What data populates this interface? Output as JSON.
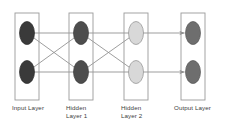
{
  "diagram": {
    "type": "neural-network-architecture",
    "title": "",
    "background_color": "#ffffff",
    "edge_color": "#8c8c8c",
    "box_stroke_color": "#9a9a9a",
    "label_color": "#3c3c3c",
    "layers": [
      {
        "id": "input",
        "label_lines": [
          "Input Layer"
        ],
        "node_count": 2,
        "node_fill": "#3a3a3a",
        "node_stroke": "#2e2e2e",
        "box": {
          "x": 15,
          "y": 13,
          "w": 24,
          "h": 87
        },
        "label_x": 12,
        "label_y": 104
      },
      {
        "id": "hidden1",
        "label_lines": [
          "Hidden",
          "Layer 1"
        ],
        "node_count": 2,
        "node_fill": "#4d4d4d",
        "node_stroke": "#3d3d3d",
        "box": {
          "x": 69,
          "y": 13,
          "w": 24,
          "h": 87
        },
        "label_x": 66,
        "label_y": 104
      },
      {
        "id": "hidden2",
        "label_lines": [
          "Hidden",
          "Layer 2"
        ],
        "node_count": 2,
        "node_fill": "#d8d8d8",
        "node_stroke": "#8f8f8f",
        "box": {
          "x": 124,
          "y": 13,
          "w": 24,
          "h": 87
        },
        "label_x": 121,
        "label_y": 104
      },
      {
        "id": "output",
        "label_lines": [
          "Output Layer"
        ],
        "node_count": 2,
        "node_fill": "#6e6e6e",
        "node_stroke": "#565656",
        "box": {
          "x": 181,
          "y": 13,
          "w": 24,
          "h": 87
        },
        "label_x": 174,
        "label_y": 104
      }
    ],
    "node_geometry": {
      "rx": 7.5,
      "ry": 11.5,
      "row_centers_y": [
        33,
        72
      ],
      "column_centers_x": [
        27,
        81,
        136,
        193
      ]
    },
    "connection_groups": [
      {
        "id": "input-to-hidden1",
        "from": "input",
        "to": "hidden1",
        "fully_connected": true,
        "arrowheads": false,
        "edges": [
          [
            0,
            0
          ],
          [
            0,
            1
          ],
          [
            1,
            0
          ],
          [
            1,
            1
          ]
        ]
      },
      {
        "id": "hidden1-to-hidden2",
        "from": "hidden1",
        "to": "hidden2",
        "fully_connected": true,
        "arrowheads": false,
        "edges": [
          [
            0,
            0
          ],
          [
            0,
            1
          ],
          [
            1,
            0
          ],
          [
            1,
            1
          ]
        ]
      },
      {
        "id": "hidden2-to-output",
        "from": "hidden2",
        "to": "output",
        "fully_connected": false,
        "arrowheads": true,
        "edges": [
          [
            0,
            0
          ],
          [
            1,
            1
          ]
        ]
      }
    ]
  }
}
